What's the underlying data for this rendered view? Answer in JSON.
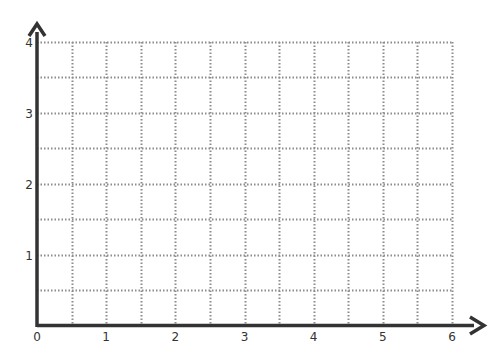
{
  "chart_data": {
    "type": "line",
    "title": "",
    "xlabel": "",
    "ylabel": "",
    "xlim": [
      0,
      6
    ],
    "ylim": [
      0,
      4
    ],
    "x_ticks": [
      "0",
      "1",
      "2",
      "3",
      "4",
      "5",
      "6"
    ],
    "y_ticks": [
      "1",
      "2",
      "3",
      "4"
    ],
    "grid": true,
    "grid_step": 0.5,
    "grid_style": "dotted",
    "series": [],
    "legend": null
  },
  "colors": {
    "axis": "#333333",
    "grid": "#8c8c8c",
    "background": "#ffffff"
  }
}
